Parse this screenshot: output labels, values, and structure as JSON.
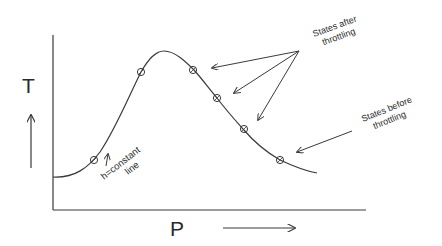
{
  "diagram": {
    "axes": {
      "y_label": "T",
      "x_label": "P",
      "y_arrow": "up",
      "x_arrow": "right"
    },
    "curve": {
      "label_line1": "h=constant",
      "label_line2": "line",
      "description": "constant enthalpy (isenthalpic) curve with maximum (inversion point)"
    },
    "annotations": {
      "after": {
        "line1": "States after",
        "line2": "throttling"
      },
      "before": {
        "line1": "States before",
        "line2": "throttling"
      }
    },
    "state_points_count": 6,
    "colors": {
      "line": "#3a3a3a",
      "text": "#2a2a2a",
      "background": "#ffffff"
    }
  }
}
